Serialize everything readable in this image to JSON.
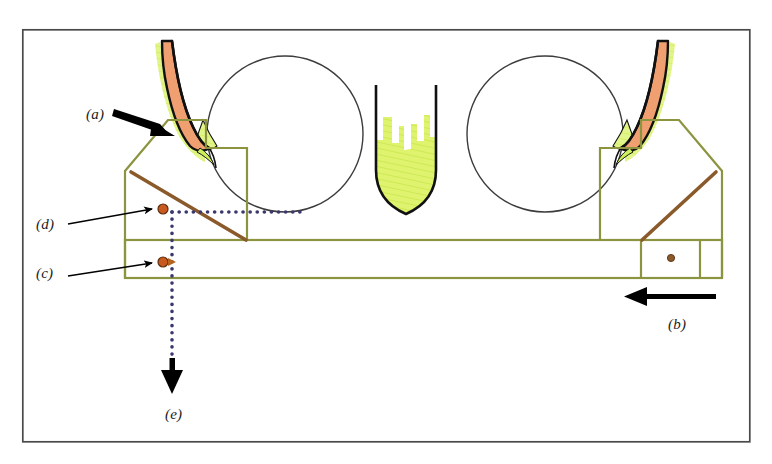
{
  "figure": {
    "background_color": "#ffffff",
    "frame": {
      "name": "outer-border",
      "x": 22,
      "y": 29,
      "width": 728,
      "height": 413,
      "stroke": "#4a4a4a",
      "stroke_width": 1.6
    },
    "palette": {
      "blade_orange": "#f0a070",
      "blade_outline": "#111111",
      "green_hatch": "#d7f060",
      "green_hatch_light": "#ddf27a",
      "mechanism_olive": "#8d9440",
      "link_brown": "#8a5a2b",
      "pivot_orange": "#c85a20",
      "dotted_navy": "#3b3870",
      "arrow_black": "#000000",
      "circle_outline": "#3c3c3c"
    }
  },
  "labels": [
    {
      "id": "a",
      "text": "(a)",
      "x": 86,
      "y": 106,
      "meaning": "blade-tip-contact-point"
    },
    {
      "id": "d",
      "text": "(d)",
      "x": 36,
      "y": 216,
      "meaning": "upper-pivot-joint"
    },
    {
      "id": "c",
      "text": "(c)",
      "x": 36,
      "y": 265,
      "meaning": "lower-pivot-joint"
    },
    {
      "id": "b",
      "text": "(b)",
      "x": 668,
      "y": 316,
      "meaning": "carriage-travel-direction"
    },
    {
      "id": "e",
      "text": "(e)",
      "x": 165,
      "y": 406,
      "meaning": "vertical-reference-axis"
    }
  ],
  "rollers": [
    {
      "name": "left-roller",
      "cx": 285,
      "cy": 134,
      "r": 78,
      "fill": "none",
      "stroke": "#3c3c3c"
    },
    {
      "name": "right-roller",
      "cx": 545,
      "cy": 134,
      "r": 78,
      "fill": "none",
      "stroke": "#3c3c3c"
    }
  ],
  "blades": [
    {
      "name": "left-blade-tip",
      "side": "left",
      "orange_fill": "#f0a070",
      "green_fill": "#d7f060",
      "outline": "#111111",
      "description": "curved tapering blade angled down-right with green web behind"
    },
    {
      "name": "right-blade-tip",
      "side": "right",
      "orange_fill": "#f0a070",
      "green_fill": "#d7f060",
      "outline": "#111111",
      "description": "mirrored curved tapering blade angled down-left with green web behind"
    }
  ],
  "center_body": {
    "name": "center-material-mass",
    "fill": "#d7f060",
    "outline": "#111111",
    "description": "U-shaped hatched mass between the two rollers with notched top edge"
  },
  "mechanism": {
    "name": "linkage-frame",
    "stroke": "#8d9440",
    "stroke_width": 2.2,
    "carriage_bar": {
      "x": 125,
      "y": 240,
      "width": 597,
      "height": 38
    },
    "left_frame_points": "125,240 125,171 168,120 206,120 206,148 247,148 247,240",
    "right_frame_points": "722,240 722,171 679,120 641,120 641,148 600,148 600,240",
    "inner_divider_left_x": 247,
    "inner_divider_right_x": 641,
    "inner_divider_right2_x": 700
  },
  "links": [
    {
      "name": "left-connecting-rod",
      "x1": 131,
      "y1": 172,
      "x2": 246,
      "y2": 240,
      "stroke": "#8a5a2b",
      "stroke_width": 3.4
    },
    {
      "name": "right-connecting-rod",
      "x1": 716,
      "y1": 172,
      "x2": 642,
      "y2": 240,
      "stroke": "#8a5a2b",
      "stroke_width": 3.4
    }
  ],
  "pivots": [
    {
      "name": "pivot-d",
      "cx": 163,
      "cy": 209,
      "r": 5.0,
      "fill": "#c85a20",
      "stroke": "#5c2f10"
    },
    {
      "name": "pivot-c",
      "cx": 163,
      "cy": 262,
      "r": 5.0,
      "fill": "#c85a20",
      "stroke": "#5c2f10"
    },
    {
      "name": "pivot-right",
      "cx": 671,
      "cy": 258,
      "r": 3.6,
      "fill": "#8a5a2b",
      "stroke": "#5c2f10"
    }
  ],
  "dotted_lines": [
    {
      "name": "horizontal-datum",
      "orientation": "horizontal",
      "x1": 172,
      "y1": 212,
      "x2": 300,
      "y2": 212,
      "color": "#3b3870",
      "dot_size": 3.4,
      "gap": 7
    },
    {
      "name": "vertical-datum",
      "orientation": "vertical",
      "x1": 172,
      "y1": 212,
      "x2": 172,
      "y2": 360,
      "color": "#3b3870",
      "dot_size": 3.4,
      "gap": 7
    }
  ],
  "arrows": [
    {
      "name": "arrow-a",
      "type": "thick-leader",
      "from": {
        "x": 116,
        "y": 111
      },
      "to": {
        "x": 172,
        "y": 131
      },
      "color": "#000000"
    },
    {
      "name": "arrow-d",
      "type": "thin-leader",
      "from": {
        "x": 70,
        "y": 222
      },
      "to": {
        "x": 158,
        "y": 208
      },
      "color": "#000000"
    },
    {
      "name": "arrow-c",
      "type": "thin-leader",
      "from": {
        "x": 70,
        "y": 272
      },
      "to": {
        "x": 158,
        "y": 262
      },
      "color": "#000000"
    },
    {
      "name": "arrow-b",
      "type": "thick-straight",
      "from": {
        "x": 716,
        "y": 297
      },
      "to": {
        "x": 624,
        "y": 297
      },
      "color": "#000000"
    },
    {
      "name": "arrow-e",
      "type": "thick-straight",
      "from": {
        "x": 172,
        "y": 360
      },
      "to": {
        "x": 172,
        "y": 392
      },
      "color": "#000000"
    }
  ]
}
